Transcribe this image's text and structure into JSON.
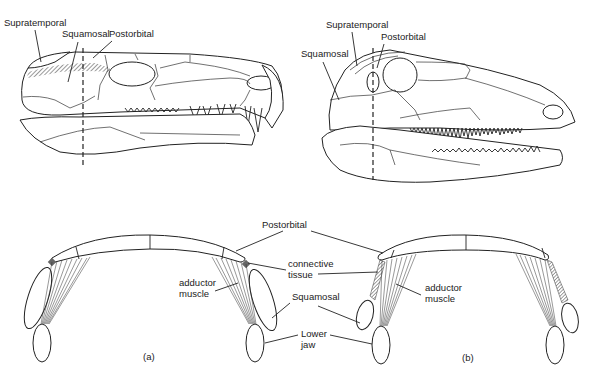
{
  "figure": {
    "type": "anatomical-diagram"
  },
  "skull_a": {
    "labels": {
      "supratemporal": "Supratemporal",
      "squamosal": "Squamosal",
      "postorbital": "Postorbital"
    }
  },
  "skull_b": {
    "labels": {
      "supratemporal": "Supratemporal",
      "squamosal": "Squamosal",
      "postorbital": "Postorbital"
    }
  },
  "sections": {
    "labels": {
      "postorbital": "Postorbital",
      "connective_tissue_1": "connective",
      "connective_tissue_2": "tissue",
      "adductor_a_1": "adductor",
      "adductor_a_2": "muscle",
      "adductor_b_1": "adductor",
      "adductor_b_2": "muscle",
      "squamosal": "Squamosal",
      "lower_jaw_1": "Lower",
      "lower_jaw_2": "jaw"
    },
    "panel_a": "(a)",
    "panel_b": "(b)"
  }
}
